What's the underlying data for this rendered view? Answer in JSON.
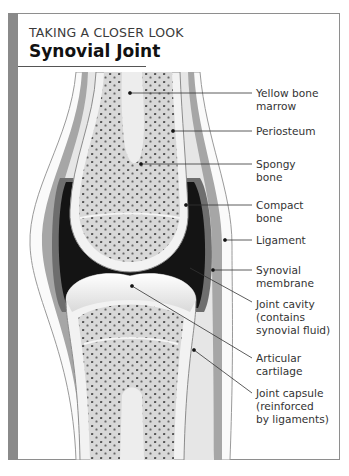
{
  "header": {
    "kicker": "TAKING A CLOSER LOOK",
    "title": "Synovial Joint"
  },
  "labels": [
    {
      "id": "yellow-bone-marrow",
      "text": "Yellow bone\nmarrow",
      "top": 87
    },
    {
      "id": "periosteum",
      "text": "Periosteum",
      "top": 129
    },
    {
      "id": "spongy-bone",
      "text": "Spongy\nbone",
      "top": 157
    },
    {
      "id": "compact-bone",
      "text": "Compact\nbone",
      "top": 199
    },
    {
      "id": "ligament",
      "text": "Ligament",
      "top": 234
    },
    {
      "id": "synovial-membrane",
      "text": "Synovial\nmembrane",
      "top": 262
    },
    {
      "id": "joint-cavity",
      "text": "Joint cavity\n(contains\nsynovial fluid)",
      "top": 297
    },
    {
      "id": "articular-cartilage",
      "text": "Articular\ncartilage",
      "top": 354
    },
    {
      "id": "joint-capsule",
      "text": "Joint capsule\n(reinforced\nby ligaments)",
      "top": 389
    }
  ],
  "colors": {
    "frame": "#8e8e8e",
    "side_bar": "#8a8a8a",
    "cavity": "#141414",
    "capsule": "#a6a6a6",
    "bone": "#d6d6d6",
    "cartilage": "#f4f4f4"
  }
}
